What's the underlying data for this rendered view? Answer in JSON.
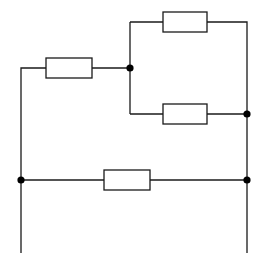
{
  "diagram": {
    "type": "circuit-schematic",
    "colors": {
      "stroke": "#1a1a1a",
      "node": "#000000",
      "background": "#ffffff"
    },
    "resistors": [
      {
        "id": "R-left",
        "x": 46,
        "y": 58,
        "w": 46,
        "h": 20
      },
      {
        "id": "R-top",
        "x": 163,
        "y": 12,
        "w": 44,
        "h": 20
      },
      {
        "id": "R-middle",
        "x": 163,
        "y": 104,
        "w": 44,
        "h": 20
      },
      {
        "id": "R-bottom",
        "x": 104,
        "y": 170,
        "w": 46,
        "h": 20
      }
    ],
    "nodes": [
      {
        "id": "junction-left-parallel",
        "x": 130,
        "y": 68
      },
      {
        "id": "junction-right-parallel",
        "x": 247,
        "y": 114
      },
      {
        "id": "junction-left-bottom",
        "x": 21,
        "y": 180
      },
      {
        "id": "junction-right-bottom",
        "x": 247,
        "y": 180
      }
    ],
    "terminals": [
      {
        "id": "terminal-left",
        "x": 21,
        "y": 253
      },
      {
        "id": "terminal-right",
        "x": 247,
        "y": 253
      }
    ]
  }
}
